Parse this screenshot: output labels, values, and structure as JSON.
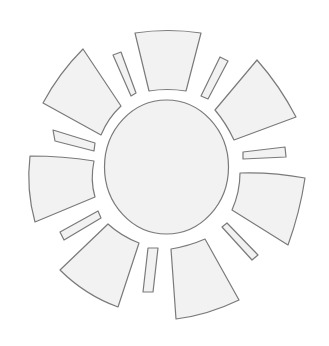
{
  "figure": {
    "colors": {
      "background": "#ffffff",
      "fill": "#f2f2f2",
      "stroke": "#7a7a7a"
    },
    "stroke_width": 1.2
  },
  "center": {
    "cx": 166.5,
    "cy": 167,
    "rx": 62,
    "ry": 67
  },
  "wedges": [
    {
      "name": "top",
      "d": "M135,33 Q168,28 201,33 L186,91 Q167,88 149,91 Z"
    },
    {
      "name": "top-right",
      "d": "M257,60 Q280,86 296,117 L234,140 Q226,123 215,110 Z"
    },
    {
      "name": "right",
      "d": "M240,173 Q273,172 305,178 Q300,212 288,245 L232,210 Q240,192 240,173 Z"
    },
    {
      "name": "bottom-right",
      "d": "M171,249 Q189,246 205,239 L239,300 Q208,315 176,319 Z"
    },
    {
      "name": "bottom-left",
      "d": "M108,224 Q121,236 139,243 L118,307 Q85,295 60,270 Z"
    },
    {
      "name": "left",
      "d": "M30,156 Q63,156 94,161 Q90,180 95,197 L35,222 Q26,190 30,156 Z"
    },
    {
      "name": "top-left",
      "d": "M83,49 L121,106 Q108,118 101,135 L43,103 Q59,73 83,49 Z"
    }
  ],
  "bars": [
    {
      "name": "top-left-bar",
      "points": "113,55 121,52 136,93 131,96"
    },
    {
      "name": "top-right-bar",
      "points": "220,57 228,61 208,99 201,96"
    },
    {
      "name": "right-bar",
      "points": "243,152 285,147 286,157 243,159"
    },
    {
      "name": "bottom-right-bar",
      "points": "222,227 227,223 258,255 252,260"
    },
    {
      "name": "bottom-bar",
      "points": "148,248 158,248 153,292 143,292"
    },
    {
      "name": "bottom-left-bar",
      "points": "60,232 98,211 101,218 64,240"
    },
    {
      "name": "left-bar",
      "points": "53,130 95,143 94,151 55,141"
    }
  ]
}
